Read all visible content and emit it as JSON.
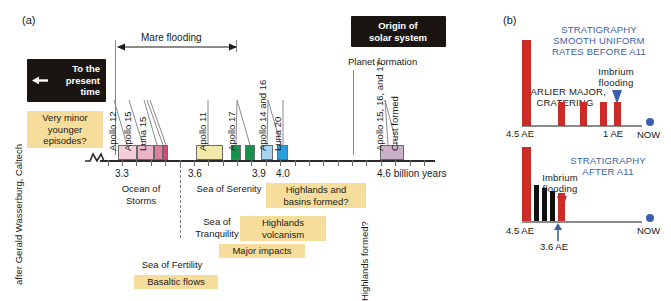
{
  "figure": {
    "credit": "after Gerald Wasserburg, Caltech",
    "panel_a_letter": "(a)",
    "panel_b_letter": "(b)"
  },
  "panel_a": {
    "callouts": {
      "present_time": "To the\npresent\ntime",
      "present_time_l1": "To the",
      "present_time_l2": "present",
      "present_time_l3": "time",
      "origin": "Origin of\nsolar system",
      "origin_l1": "Origin of",
      "origin_l2": "solar system",
      "planet_formation": "Planet formation",
      "mare_flooding": "Mare flooding",
      "very_minor_l1": "Very minor",
      "very_minor_l2": "younger",
      "very_minor_l3": "episodes?"
    },
    "axis": {
      "unit_label": "4.6 billion years",
      "ticks": [
        "3.3",
        "3.6",
        "3.9",
        "4.0"
      ],
      "tick_values": [
        3.3,
        3.6,
        3.9,
        4.0,
        4.6
      ],
      "range_start": 3.15,
      "range_end": 4.7
    },
    "samples": [
      {
        "label": "Apollo 12",
        "color": "#f4cfd9",
        "x": 118,
        "w": 19
      },
      {
        "label": "Apollo 15",
        "color": "#eeb2c6",
        "x": 137,
        "w": 17
      },
      {
        "label": "Luna 15",
        "color": "#de7d9e",
        "x": 154,
        "w": 9
      },
      {
        "label": "",
        "color": "#d34b72",
        "x": 163,
        "w": 5
      },
      {
        "label": "Apollo 11",
        "color": "#f2e9a8",
        "x": 196,
        "w": 27
      },
      {
        "label": "Apollo 17",
        "color": "#17924b",
        "x": 231,
        "w": 10
      },
      {
        "label": "",
        "color": "#17924b",
        "x": 245,
        "w": 10
      },
      {
        "label": "Apollo 14 and 16",
        "color": "#a6d4f0",
        "x": 261,
        "w": 12
      },
      {
        "label": "Luna 20",
        "color": "#2b9ede",
        "x": 277,
        "w": 11
      },
      {
        "label": "Apollo 15, 16, and 17",
        "color": "#c9afc8",
        "x": 380,
        "w": 24
      }
    ],
    "sample_labels": [
      "Apollo 12",
      "Apollo 15",
      "Luna 15",
      "Apollo 11",
      "Apollo 17",
      "Apollo 14 and 16",
      "Luna 20",
      "Apollo 15, 16, and 17",
      "Crust formed"
    ],
    "annotations_plain": [
      {
        "text_l1": "Ocean of",
        "text_l2": "Storms"
      },
      {
        "text_l1": "Sea of Serenity",
        "text_l2": ""
      },
      {
        "text_l1": "Sea of",
        "text_l2": "Tranquility"
      },
      {
        "text_l1": "Sea of Fertility",
        "text_l2": ""
      }
    ],
    "labels": {
      "ocean_of_storms_1": "Ocean of",
      "ocean_of_storms_2": "Storms",
      "sea_of_serenity": "Sea of Serenity",
      "sea_of_tranquility_1": "Sea of",
      "sea_of_tranquility_2": "Tranquility",
      "sea_of_fertility": "Sea of Fertility",
      "highlands_basins_1": "Highlands and",
      "highlands_basins_2": "basins formed?",
      "highlands_volcanism_1": "Highlands",
      "highlands_volcanism_2": "volcanism",
      "major_impacts": "Major impacts",
      "basaltic_flows": "Basaltic flows",
      "highlands_formed": "Highlands formed?",
      "crust_formed": "Crust formed"
    }
  },
  "panel_b": {
    "chart_top": {
      "type": "bar",
      "title_l1": "STRATIGRAPHY",
      "title_l2": "SMOOTH UNIFORM",
      "title_l3": "RATES BEFORE A11",
      "annotation_1_l1": "EARLIER MAJOR,",
      "annotation_1_l2": "CRATERING",
      "annotation_2_l1": "Imbrium",
      "annotation_2_l2": "flooding",
      "x_start_label": "4.5 AE",
      "x_mid_label": "1 AE",
      "x_end_label": "NOW",
      "bar_color": "#cc2b27",
      "bars": [
        {
          "x": 0.0,
          "height": 1.0,
          "color": "#cc2b27"
        },
        {
          "x": 0.3,
          "height": 0.26,
          "color": "#cc2b27"
        },
        {
          "x": 0.5,
          "height": 0.26,
          "color": "#cc2b27"
        },
        {
          "x": 0.68,
          "height": 0.26,
          "color": "#cc2b27"
        },
        {
          "x": 0.8,
          "height": 0.26,
          "color": "#cc2b27"
        }
      ]
    },
    "chart_bottom": {
      "type": "bar",
      "title_l1": "STRATIGRAPHY",
      "title_l2": "AFTER A11",
      "annotation_l1": "Imbrium",
      "annotation_l2": "flooding",
      "x_start_label": "4.5 AE",
      "x_marker_label": "3.6 AE",
      "x_end_label": "NOW",
      "bars": [
        {
          "x": 0.0,
          "height": 1.0,
          "color": "#cc2b27"
        },
        {
          "x": 0.085,
          "height": 0.5,
          "color": "#101010"
        },
        {
          "x": 0.135,
          "height": 0.44,
          "color": "#101010"
        },
        {
          "x": 0.185,
          "height": 0.38,
          "color": "#101010"
        },
        {
          "x": 0.235,
          "height": 0.36,
          "color": "#cc2b27"
        }
      ]
    }
  }
}
